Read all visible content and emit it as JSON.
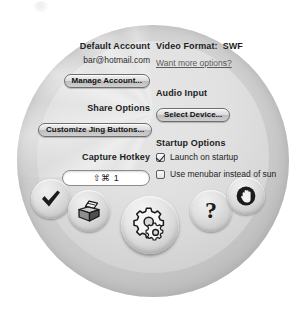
{
  "window": {
    "title": "Jing Preferences"
  },
  "preferences": {
    "left_column": {
      "default_account": {
        "label": "Default Account",
        "value": "bar@hotmail.com",
        "button": "Manage Account..."
      },
      "share_options": {
        "label": "Share Options",
        "button": "Customize Jing Buttons..."
      },
      "capture_hotkey": {
        "label": "Capture Hotkey",
        "value": "⇧⌘ 1"
      }
    },
    "right_column": {
      "video_format": {
        "label": "Video Format:",
        "value": "SWF",
        "link": "Want more options?"
      },
      "audio_input": {
        "label": "Audio Input",
        "button": "Select Device..."
      },
      "startup_options": {
        "label": "Startup Options",
        "checkboxes": [
          {
            "label": "Launch on startup",
            "checked": true
          },
          {
            "label": "Use menubar instead of sun",
            "checked": false
          }
        ]
      }
    }
  },
  "dock": {
    "buttons": [
      {
        "name": "capture",
        "icon": "checkmark-icon",
        "label": "Capture"
      },
      {
        "name": "history",
        "icon": "history-box-icon",
        "label": "History"
      },
      {
        "name": "settings",
        "icon": "gears-icon",
        "label": "Settings"
      },
      {
        "name": "help",
        "icon": "question-mark-icon",
        "label": "Help"
      },
      {
        "name": "quit",
        "icon": "stop-hand-icon",
        "label": "Quit"
      }
    ]
  },
  "colors": {
    "page_background": "#ffffff",
    "sun_rim": "#a8a8a8",
    "sun_face": "#e1e1e1",
    "text": "#1d1d1d",
    "link": "#5a5a5a",
    "field_background": "#ffffff"
  }
}
